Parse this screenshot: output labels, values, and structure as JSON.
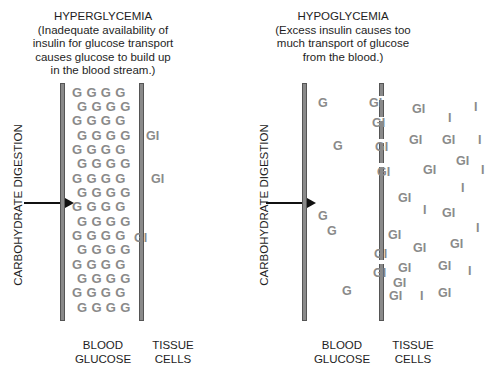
{
  "panels": [
    {
      "id": "hyperglycemia",
      "title": "HYPERGLYCEMIA",
      "description_lines": [
        "(Inadequate availability of",
        "insulin for glucose transport",
        "causes glucose to build up",
        "in the blood stream.)"
      ],
      "side_label": "CARBOHYDRATE DIGESTION",
      "blood_label": [
        "BLOOD",
        "GLUCOSE"
      ],
      "tissue_label": [
        "TISSUE",
        "CELLS"
      ],
      "blood_rows": [
        "GGGG",
        "GGGG",
        "GGGG",
        "GGGG",
        "GGGG",
        "GGGG",
        "GGGG",
        "GGGG",
        "GGGG",
        "GGGG",
        "GGGG",
        "GGGG",
        "GGGG",
        "GGGG",
        "GGGG",
        "GGGG"
      ],
      "tissue_molecules": [
        "GI",
        "GI",
        "GI"
      ]
    },
    {
      "id": "hypoglycemia",
      "title": "HYPOGLYCEMIA",
      "description_lines": [
        "(Excess insulin causes too",
        "much transport of glucose",
        "from the blood.)"
      ],
      "side_label": "CARBOHYDRATE DIGESTION",
      "blood_label": [
        "BLOOD",
        "GLUCOSE"
      ],
      "tissue_label": [
        "TISSUE",
        "CELLS"
      ],
      "blood_molecules": [
        "G",
        "G",
        "G",
        "G",
        "G"
      ],
      "membrane_molecules": [
        "GI",
        "GI",
        "GI",
        "GI",
        "GI",
        "GI"
      ],
      "tissue_molecules": [
        "GI",
        "I",
        "GI",
        "GI",
        "I",
        "GI",
        "GI",
        "I",
        "I",
        "GI",
        "I",
        "GI",
        "GI",
        "GI",
        "I",
        "GI",
        "GI",
        "GI",
        "I",
        "GI",
        "GI",
        "I",
        "GI",
        "I",
        "GI",
        "GI"
      ]
    }
  ],
  "colors": {
    "molecule": "#8a8a8a",
    "membrane": "#8a8a8a",
    "text": "#1e1e1e",
    "arrow": "#111111"
  }
}
